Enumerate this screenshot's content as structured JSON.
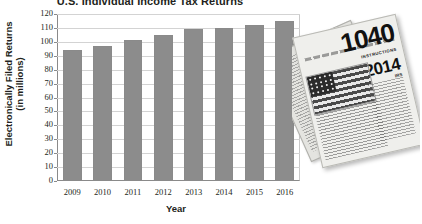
{
  "chart_data": {
    "type": "bar",
    "title": "U.S. Individual Income Tax Returns",
    "xlabel": "Year",
    "ylabel_line1": "Electronically Filed Returns",
    "ylabel_line2": "(in millions)",
    "categories": [
      "2009",
      "2010",
      "2011",
      "2012",
      "2013",
      "2014",
      "2015",
      "2016"
    ],
    "values": [
      94,
      97,
      101,
      105,
      109,
      110,
      112,
      115
    ],
    "ylim": [
      0,
      120
    ],
    "yticks": [
      "0",
      "10",
      "20",
      "30",
      "40",
      "50",
      "60",
      "70",
      "80",
      "90",
      "100",
      "110",
      "120"
    ],
    "ytick_values": [
      0,
      10,
      20,
      30,
      40,
      50,
      60,
      70,
      80,
      90,
      100,
      110,
      120
    ],
    "grid": true,
    "legend": "none",
    "bar_color": "#8c8c8c",
    "axis_color": "#8a8a8a",
    "grid_color": "#d3d3d3"
  },
  "photo": {
    "form_number": "1040",
    "instructions_label": "INSTRUCTIONS",
    "year": "2014",
    "side_heading": "IRS"
  }
}
